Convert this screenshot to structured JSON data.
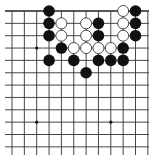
{
  "board": {
    "size": 19,
    "visible_cols": [
      2,
      13
    ],
    "visible_rows": [
      1,
      12
    ],
    "origin_x": 12,
    "origin_y": 11,
    "spacing": 12.35,
    "line_color": "#333333",
    "edge_color": "#222222",
    "background": "#ffffff",
    "star_points": [
      [
        4,
        4
      ],
      [
        10,
        4
      ],
      [
        4,
        10
      ],
      [
        10,
        10
      ]
    ],
    "stone_radius": 5.8
  },
  "stones": {
    "black": [
      [
        5,
        1
      ],
      [
        5,
        2
      ],
      [
        5,
        3
      ],
      [
        6,
        4
      ],
      [
        5,
        5
      ],
      [
        7,
        5
      ],
      [
        8,
        6
      ],
      [
        9,
        2
      ],
      [
        9,
        3
      ],
      [
        9,
        5
      ],
      [
        10,
        5
      ],
      [
        11,
        4
      ],
      [
        11,
        5
      ],
      [
        12,
        1
      ],
      [
        12,
        2
      ],
      [
        12,
        3
      ]
    ],
    "white": [
      [
        6,
        2
      ],
      [
        6,
        3
      ],
      [
        8,
        2
      ],
      [
        8,
        3
      ],
      [
        7,
        4
      ],
      [
        8,
        4
      ],
      [
        9,
        4
      ],
      [
        10,
        4
      ],
      [
        11,
        1
      ],
      [
        11,
        2
      ],
      [
        11,
        3
      ]
    ]
  },
  "colors": {
    "black_stone": "#111111",
    "white_stone": "#ffffff",
    "white_stone_outline": "#222222"
  }
}
